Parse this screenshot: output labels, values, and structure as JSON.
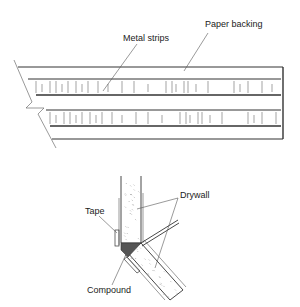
{
  "figure": {
    "top": {
      "title": "Metal-reinforced corner tape",
      "labels": {
        "metal_strips": "Metal strips",
        "paper_backing": "Paper backing"
      }
    },
    "bottom": {
      "title": "Outside corner joint detail",
      "labels": {
        "tape": "Tape",
        "drywall": "Drywall",
        "compound": "Compound"
      }
    },
    "colors": {
      "line": "#333333",
      "compound_fill": "#555555",
      "drywall_speckle": "#999999"
    }
  }
}
